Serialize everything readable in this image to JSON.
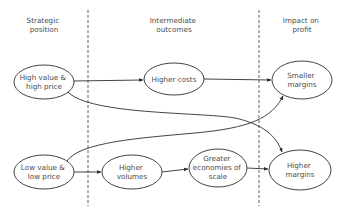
{
  "diagram": {
    "columns": [
      {
        "id": "strategic",
        "label_lines": [
          "Strategic",
          "position"
        ],
        "x": 44
      },
      {
        "id": "intermediate",
        "label_lines": [
          "Intermediate",
          "outcomes"
        ],
        "x": 174
      },
      {
        "id": "impact",
        "label_lines": [
          "Impact on",
          "profit"
        ],
        "x": 302
      }
    ],
    "nodes": [
      {
        "id": "high_value",
        "label_lines": [
          "High value &",
          "high price"
        ],
        "cx": 44,
        "cy": 82,
        "rx": 30,
        "ry": 17
      },
      {
        "id": "higher_costs",
        "label_lines": [
          "Higher costs"
        ],
        "cx": 174,
        "cy": 79,
        "rx": 30,
        "ry": 16
      },
      {
        "id": "smaller_margins",
        "label_lines": [
          "Smaller",
          "margins"
        ],
        "cx": 302,
        "cy": 80,
        "rx": 30,
        "ry": 19
      },
      {
        "id": "low_value",
        "label_lines": [
          "Low value &",
          "low price"
        ],
        "cx": 44,
        "cy": 172,
        "rx": 30,
        "ry": 17
      },
      {
        "id": "higher_volumes",
        "label_lines": [
          "Higher",
          "volumes"
        ],
        "cx": 132,
        "cy": 172,
        "rx": 30,
        "ry": 17
      },
      {
        "id": "economies",
        "label_lines": [
          "Greater",
          "economies of",
          "scale"
        ],
        "cx": 218,
        "cy": 168,
        "rx": 29,
        "ry": 19
      },
      {
        "id": "higher_margins",
        "label_lines": [
          "Higher",
          "margins"
        ],
        "cx": 300,
        "cy": 170,
        "rx": 31,
        "ry": 20
      }
    ],
    "edges": [
      {
        "from": "high_value",
        "to": "higher_costs"
      },
      {
        "from": "higher_costs",
        "to": "smaller_margins"
      },
      {
        "from": "high_value",
        "to": "higher_margins"
      },
      {
        "from": "low_value",
        "to": "smaller_margins"
      },
      {
        "from": "low_value",
        "to": "higher_volumes"
      },
      {
        "from": "higher_volumes",
        "to": "economies"
      },
      {
        "from": "economies",
        "to": "higher_margins"
      }
    ],
    "dividers": [
      {
        "x": 88
      },
      {
        "x": 259
      }
    ]
  }
}
